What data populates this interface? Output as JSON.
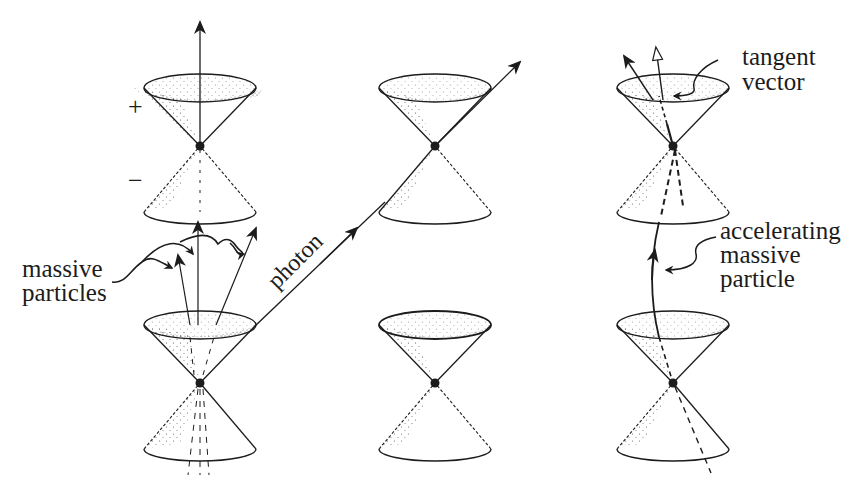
{
  "figure": {
    "colors": {
      "ink": "#1c1c1c",
      "background": "#ffffff"
    }
  },
  "labels": {
    "plus": "+",
    "minus": "−",
    "massive_particles_line1": "massive",
    "massive_particles_line2": "particles",
    "photon": "photon",
    "tangent_vector_line1": "tangent",
    "tangent_vector_line2": "vector",
    "accelerating_line1": "accelerating",
    "accelerating_line2": "massive",
    "accelerating_line3": "particle"
  },
  "cones": [
    {
      "id": "left-top",
      "apex": [
        200,
        146
      ],
      "future_sign": "+",
      "past_sign": "-"
    },
    {
      "id": "left-bottom",
      "apex": [
        200,
        383
      ]
    },
    {
      "id": "middle-top",
      "apex": [
        435,
        146
      ]
    },
    {
      "id": "middle-bottom",
      "apex": [
        435,
        383
      ]
    },
    {
      "id": "right-top",
      "apex": [
        673,
        146
      ]
    },
    {
      "id": "right-bottom",
      "apex": [
        673,
        383
      ]
    }
  ]
}
